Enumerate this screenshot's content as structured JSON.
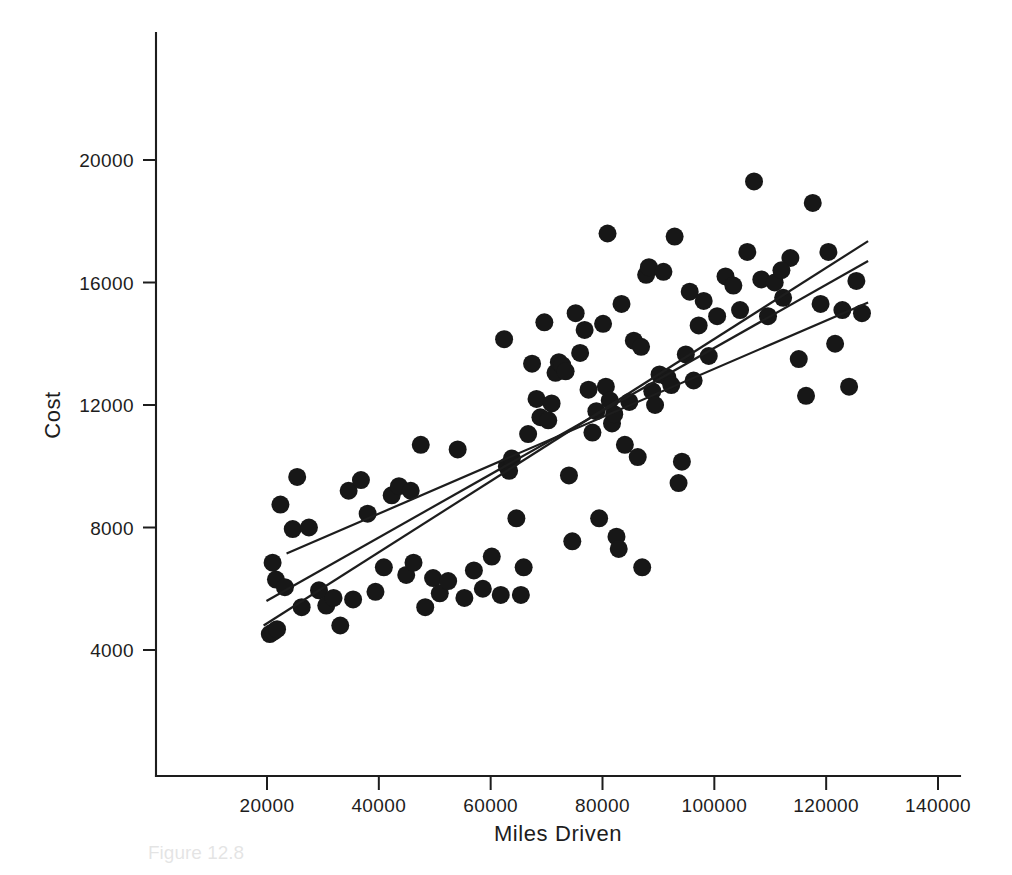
{
  "figure": {
    "caption": "Figure 12.8",
    "caption_visible": false
  },
  "chart_data": {
    "type": "scatter",
    "title": "",
    "xlabel": "Miles Driven",
    "ylabel": "Cost",
    "xlim": [
      0,
      150000
    ],
    "ylim": [
      0,
      22600
    ],
    "grid": false,
    "legend": "none",
    "marker": {
      "shape": "circle",
      "color": "#171717",
      "radius_px": 9
    },
    "xticks": [
      20000,
      40000,
      60000,
      80000,
      100000,
      120000,
      140000
    ],
    "xtick_labels": [
      "20000",
      "40000",
      "60000",
      "80000",
      "100000",
      "120000",
      "140000"
    ],
    "yticks": [
      4000,
      8000,
      12000,
      16000,
      20000
    ],
    "ytick_labels": [
      "4000",
      "8000",
      "12000",
      "16000",
      "20000"
    ],
    "n_points": 118,
    "points": [
      [
        20500,
        4520
      ],
      [
        21200,
        4600
      ],
      [
        21800,
        4680
      ],
      [
        21000,
        6850
      ],
      [
        21600,
        6300
      ],
      [
        22400,
        8750
      ],
      [
        23200,
        6050
      ],
      [
        25400,
        9650
      ],
      [
        24600,
        7950
      ],
      [
        26200,
        5400
      ],
      [
        27500,
        8000
      ],
      [
        29300,
        5950
      ],
      [
        30600,
        5450
      ],
      [
        31900,
        5700
      ],
      [
        33100,
        4800
      ],
      [
        35400,
        5650
      ],
      [
        34600,
        9200
      ],
      [
        36800,
        9550
      ],
      [
        38000,
        8450
      ],
      [
        39400,
        5900
      ],
      [
        40900,
        6700
      ],
      [
        42300,
        9050
      ],
      [
        43600,
        9350
      ],
      [
        44900,
        6450
      ],
      [
        45700,
        9200
      ],
      [
        46200,
        6850
      ],
      [
        47500,
        10700
      ],
      [
        48300,
        5400
      ],
      [
        49700,
        6350
      ],
      [
        50900,
        5850
      ],
      [
        52400,
        6250
      ],
      [
        54100,
        10550
      ],
      [
        55300,
        5700
      ],
      [
        57000,
        6600
      ],
      [
        58600,
        6000
      ],
      [
        60200,
        7050
      ],
      [
        61800,
        5800
      ],
      [
        62400,
        14150
      ],
      [
        62900,
        10000
      ],
      [
        63300,
        9850
      ],
      [
        63800,
        10250
      ],
      [
        64600,
        8300
      ],
      [
        65400,
        5800
      ],
      [
        65900,
        6700
      ],
      [
        66700,
        11050
      ],
      [
        67400,
        13350
      ],
      [
        68200,
        12200
      ],
      [
        68900,
        11600
      ],
      [
        69600,
        14700
      ],
      [
        70300,
        11500
      ],
      [
        70900,
        12050
      ],
      [
        71600,
        13050
      ],
      [
        72200,
        13400
      ],
      [
        72800,
        13300
      ],
      [
        73400,
        13100
      ],
      [
        74000,
        9700
      ],
      [
        74600,
        7550
      ],
      [
        75200,
        15000
      ],
      [
        76000,
        13700
      ],
      [
        76800,
        14450
      ],
      [
        77500,
        12500
      ],
      [
        78200,
        11100
      ],
      [
        78900,
        11800
      ],
      [
        79400,
        8300
      ],
      [
        80100,
        14650
      ],
      [
        80600,
        12600
      ],
      [
        80900,
        17600
      ],
      [
        81300,
        12150
      ],
      [
        81700,
        11400
      ],
      [
        82100,
        11700
      ],
      [
        82500,
        7700
      ],
      [
        82900,
        7300
      ],
      [
        83400,
        15300
      ],
      [
        84000,
        10700
      ],
      [
        84800,
        12100
      ],
      [
        85600,
        14100
      ],
      [
        86300,
        10300
      ],
      [
        87100,
        6700
      ],
      [
        87800,
        16250
      ],
      [
        88300,
        16500
      ],
      [
        88900,
        12450
      ],
      [
        89400,
        12000
      ],
      [
        90200,
        13000
      ],
      [
        90900,
        16350
      ],
      [
        91600,
        12900
      ],
      [
        92300,
        12650
      ],
      [
        92900,
        17500
      ],
      [
        93600,
        9450
      ],
      [
        94200,
        10150
      ],
      [
        94900,
        13650
      ],
      [
        95600,
        15700
      ],
      [
        96300,
        12800
      ],
      [
        97200,
        14600
      ],
      [
        98100,
        15400
      ],
      [
        99000,
        13600
      ],
      [
        100500,
        14900
      ],
      [
        102000,
        16200
      ],
      [
        103400,
        15900
      ],
      [
        104600,
        15100
      ],
      [
        105900,
        17000
      ],
      [
        107100,
        19300
      ],
      [
        108400,
        16100
      ],
      [
        109600,
        14900
      ],
      [
        110800,
        16000
      ],
      [
        112300,
        15500
      ],
      [
        113600,
        16800
      ],
      [
        115100,
        13500
      ],
      [
        116400,
        12300
      ],
      [
        117600,
        18600
      ],
      [
        119000,
        15300
      ],
      [
        120400,
        17000
      ],
      [
        121600,
        14000
      ],
      [
        122900,
        15100
      ],
      [
        124100,
        12600
      ],
      [
        125400,
        16050
      ],
      [
        126400,
        15000
      ],
      [
        112000,
        16400
      ],
      [
        86900,
        13900
      ]
    ],
    "fit_lines": [
      {
        "name": "fit-line-shallow",
        "x_start": 23500,
        "y_start": 7150,
        "x_end": 127500,
        "y_end": 15350
      },
      {
        "name": "fit-line-medium",
        "x_start": 19900,
        "y_start": 5600,
        "x_end": 127500,
        "y_end": 16700
      },
      {
        "name": "fit-line-steep",
        "x_start": 19400,
        "y_start": 4800,
        "x_end": 127500,
        "y_end": 17350
      }
    ]
  }
}
